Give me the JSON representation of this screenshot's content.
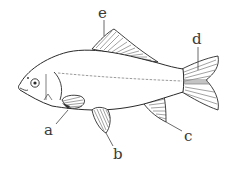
{
  "diagram": {
    "labels": [
      {
        "id": "a",
        "text": "a",
        "part": "pectoral-fin"
      },
      {
        "id": "b",
        "text": "b",
        "part": "pelvic-fin"
      },
      {
        "id": "c",
        "text": "c",
        "part": "anal-fin"
      },
      {
        "id": "d",
        "text": "d",
        "part": "caudal-fin"
      },
      {
        "id": "e",
        "text": "e",
        "part": "dorsal-fin"
      }
    ]
  }
}
